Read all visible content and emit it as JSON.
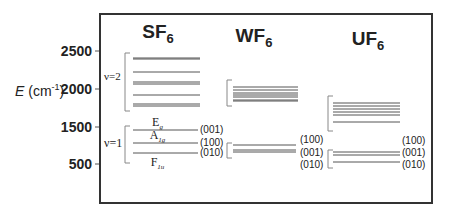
{
  "axis": {
    "label_italic": "E",
    "label_unit_open": " (cm",
    "label_unit_sup": "-1",
    "label_unit_close": ")",
    "ticks": [
      {
        "label": "2500",
        "y": 51
      },
      {
        "label": "2000",
        "y": 89
      },
      {
        "label": "1500",
        "y": 127
      },
      {
        "label": "500",
        "y": 164
      }
    ]
  },
  "frame": {
    "x1": 100,
    "y1": 14,
    "x2": 432,
    "y2": 203,
    "color": "#333333"
  },
  "molecules": [
    {
      "name": "SF",
      "sub": "6",
      "title_x": 158,
      "title_y": 38,
      "v2": {
        "label": "ν=2",
        "label_x": 104,
        "label_y": 80,
        "bracket": {
          "x": 125,
          "y1": 53,
          "y2": 111
        },
        "x1": 133,
        "x2": 200,
        "levels": [
          58,
          59,
          72,
          82,
          84,
          95,
          104,
          106
        ]
      },
      "v1": {
        "label": "ν=1",
        "label_x": 104,
        "label_y": 147,
        "bracket": {
          "x": 125,
          "y1": 126,
          "y2": 163
        },
        "x1": 133,
        "x2": 198,
        "levels": [
          {
            "y": 130,
            "mode": "(001)",
            "mode_y": 133,
            "sym": "E",
            "sym_sub": "g",
            "sym_y": 126
          },
          {
            "y": 143,
            "mode": "(100)",
            "mode_y": 146,
            "sym": "A",
            "sym_sub": "1g",
            "sym_y": 139
          },
          {
            "y": 153,
            "mode": "(010)",
            "mode_y": 156,
            "sym": "F",
            "sym_sub": "1u",
            "sym_y": 166
          }
        ],
        "mode_x": 200
      }
    },
    {
      "name": "WF",
      "sub": "6",
      "title_x": 254,
      "title_y": 42,
      "v2": {
        "bracket": {
          "x": 227,
          "y1": 80,
          "y2": 106
        },
        "x1": 233,
        "x2": 298,
        "levels": [
          87,
          90,
          93,
          95,
          97,
          100,
          101
        ]
      },
      "v1": {
        "bracket": {
          "x": 227,
          "y1": 143,
          "y2": 158
        },
        "x1": 233,
        "x2": 296,
        "levels": [
          {
            "y": 145,
            "mode": "(100)",
            "mode_y": 143
          },
          {
            "y": 150,
            "mode": "(001)",
            "mode_y": 156
          },
          {
            "y": 152,
            "mode": "(010)",
            "mode_y": 168
          }
        ],
        "mode_x": 300
      }
    },
    {
      "name": "UF",
      "sub": "6",
      "title_x": 368,
      "title_y": 45,
      "v2": {
        "bracket": {
          "x": 328,
          "y1": 96,
          "y2": 131
        },
        "x1": 333,
        "x2": 400,
        "levels": [
          103,
          106,
          109,
          112,
          115,
          122
        ]
      },
      "v1": {
        "bracket": {
          "x": 328,
          "y1": 150,
          "y2": 168
        },
        "x1": 333,
        "x2": 400,
        "levels": [
          {
            "y": 152,
            "mode": "(100)",
            "mode_y": 144
          },
          {
            "y": 155,
            "mode": "(001)",
            "mode_y": 156
          },
          {
            "y": 162,
            "mode": "(010)",
            "mode_y": 168
          }
        ],
        "mode_x": 402
      }
    }
  ],
  "colors": {
    "line": "#555555",
    "text": "#222222",
    "bracket": "#888888"
  }
}
